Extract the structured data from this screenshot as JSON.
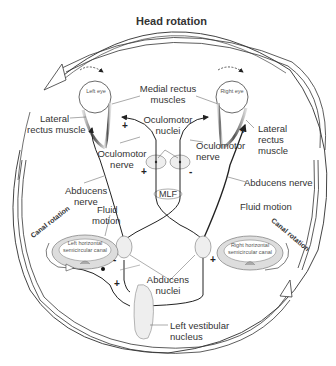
{
  "title": "Head rotation",
  "eyes": {
    "left": "Left eye",
    "right": "Right eye"
  },
  "labels": {
    "medial_rectus_1": "Medial rectus",
    "medial_rectus_2": "muscles",
    "oculomotor_nuclei_1": "Oculomotor",
    "oculomotor_nuclei_2": "nuclei",
    "lateral_rectus_left_1": "Lateral",
    "lateral_rectus_left_2": "rectus muscle",
    "lateral_rectus_right_1": "Lateral",
    "lateral_rectus_right_2": "rectus",
    "lateral_rectus_right_3": "muscle",
    "oculomotor_nerve_left_1": "Oculomotor",
    "oculomotor_nerve_left_2": "nerve",
    "oculomotor_nerve_right_1": "Oculomotor",
    "oculomotor_nerve_right_2": "nerve",
    "mlf": "MLF",
    "abducens_nerve_left_1": "Abducens",
    "abducens_nerve_left_2": "nerve",
    "abducens_nerve_right": "Abducens nerve",
    "fluid_motion_left_1": "Fluid",
    "fluid_motion_left_2": "motion",
    "fluid_motion_right": "Fluid motion",
    "canal_rotation_left": "Canal rotation",
    "canal_rotation_right": "Canal rotation",
    "left_canal_1": "Left horizontal",
    "left_canal_2": "semicircular canal",
    "right_canal_1": "Right horizontal",
    "right_canal_2": "semicircular canal",
    "abducens_nuclei_1": "Abducens",
    "abducens_nuclei_2": "nuclei",
    "vestibular_1": "Left vestibular",
    "vestibular_2": "nucleus"
  },
  "signs": {
    "plus": "+",
    "minus": "-"
  }
}
